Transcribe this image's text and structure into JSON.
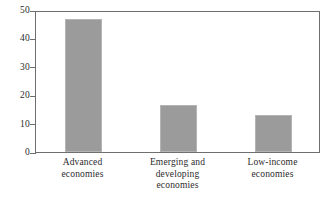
{
  "chart_data": {
    "type": "bar",
    "title": "",
    "subtitle": "",
    "xlabel": "",
    "ylabel": "",
    "categories": [
      "Advanced economies",
      "Emerging and developing economies",
      "Low-income economies"
    ],
    "category_lines": [
      [
        "Advanced",
        "economies"
      ],
      [
        "Emerging and",
        "developing",
        "economies"
      ],
      [
        "Low-income",
        "economies"
      ]
    ],
    "values": [
      47,
      16.5,
      13
    ],
    "ylim": [
      0,
      50
    ],
    "yticks": [
      0,
      10,
      20,
      30,
      40,
      50
    ],
    "ytick_labels": [
      "0",
      "10",
      "20",
      "30",
      "40",
      "50"
    ],
    "grid": false,
    "legend": null,
    "annotations": []
  },
  "style": {
    "bar_fill": "#9b9b9b",
    "bar_edge": "#b4b4b4",
    "frame_color": "#6f6f6f",
    "text_color": "#2b2b2b",
    "background": "#ffffff"
  }
}
